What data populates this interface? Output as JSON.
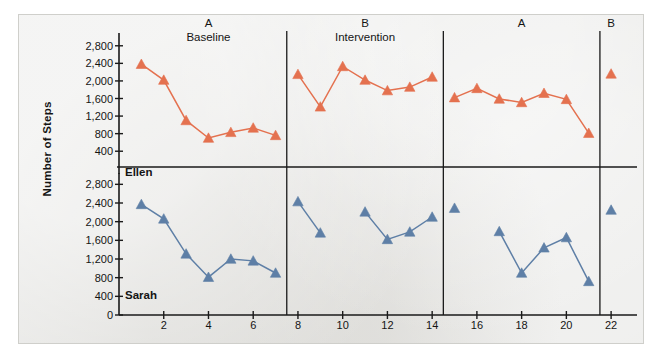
{
  "figure": {
    "background_color": "#e8e8e6",
    "border_color": "#cfcfcb"
  },
  "axes": {
    "y_title": "Number of Steps",
    "x_title": "Recess Sessions",
    "y_ticks_top": [
      "2,800",
      "2,400",
      "2,000",
      "1,600",
      "1,200",
      "800",
      "400"
    ],
    "y_ticks_bottom": [
      "2,800",
      "2,400",
      "2,000",
      "1,600",
      "1,200",
      "800",
      "400",
      "0"
    ],
    "x_ticks": [
      "2",
      "4",
      "6",
      "8",
      "10",
      "12",
      "14",
      "16",
      "18",
      "20",
      "22"
    ]
  },
  "phases": [
    {
      "letter": "A",
      "name": "Baseline",
      "center_session": 4.0
    },
    {
      "letter": "B",
      "name": "Intervention",
      "center_session": 11.0
    },
    {
      "letter": "A",
      "name": "",
      "center_session": 18.0
    },
    {
      "letter": "B",
      "name": "",
      "center_session": 22.0
    }
  ],
  "phase_dividers": [
    7.5,
    14.5,
    21.5
  ],
  "panels": [
    {
      "name": "Ellen",
      "label": "Ellen",
      "color": "#e4714f"
    },
    {
      "name": "Sarah",
      "label": "Sarah",
      "color": "#5e7fa6"
    }
  ],
  "chart_data": {
    "type": "line",
    "title": "",
    "xlabel": "Recess Sessions",
    "ylabel": "Number of Steps",
    "xlim": [
      0,
      22.8
    ],
    "ylim": [
      0,
      3000
    ],
    "grid": false,
    "legend": "none",
    "marker": "triangle",
    "phase_change_lines": [
      7.5,
      14.5,
      21.5
    ],
    "phase_labels": [
      "A Baseline",
      "B Intervention",
      "A",
      "B"
    ],
    "series": [
      {
        "name": "Ellen",
        "color": "#e4714f",
        "panel": "top",
        "segments": [
          {
            "phase": "A Baseline",
            "x": [
              1,
              2,
              3,
              4,
              5,
              6,
              7
            ],
            "y": [
              2380,
              2020,
              1100,
              700,
              830,
              930,
              760
            ]
          },
          {
            "phase": "B Intervention",
            "x": [
              8,
              9,
              10,
              11,
              12,
              13,
              14
            ],
            "y": [
              2150,
              1410,
              2330,
              2020,
              1780,
              1860,
              2090
            ]
          },
          {
            "phase": "A",
            "x": [
              15,
              16,
              17,
              18,
              19,
              20,
              21
            ],
            "y": [
              1620,
              1830,
              1590,
              1510,
              1720,
              1580,
              810
            ]
          },
          {
            "phase": "B",
            "x": [
              22
            ],
            "y": [
              2160
            ]
          }
        ]
      },
      {
        "name": "Sarah",
        "color": "#5e7fa6",
        "panel": "bottom",
        "segments": [
          {
            "phase": "A Baseline",
            "x": [
              1,
              2,
              3,
              4,
              5,
              6,
              7
            ],
            "y": [
              2370,
              2060,
              1310,
              810,
              1200,
              1160,
              900
            ]
          },
          {
            "phase": "B Intervention",
            "x": [
              8,
              9
            ],
            "y": [
              2430,
              1760
            ]
          },
          {
            "phase": "B Intervention",
            "x": [
              11,
              12,
              13,
              14
            ],
            "y": [
              2210,
              1620,
              1780,
              2100
            ]
          },
          {
            "phase": "A",
            "x": [
              15
            ],
            "y": [
              2290
            ]
          },
          {
            "phase": "A",
            "x": [
              17,
              18,
              19,
              20,
              21
            ],
            "y": [
              1790,
              900,
              1440,
              1660,
              720
            ]
          },
          {
            "phase": "B",
            "x": [
              22
            ],
            "y": [
              2250
            ]
          }
        ]
      }
    ]
  }
}
